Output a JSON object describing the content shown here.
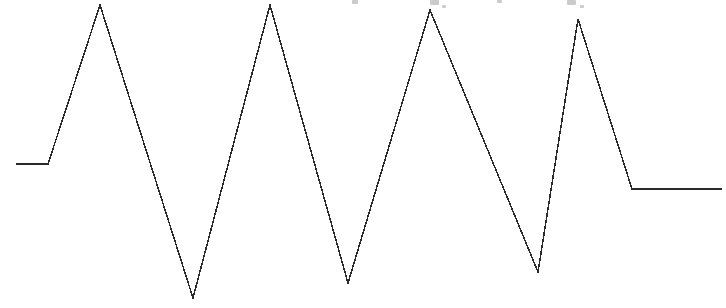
{
  "canvas": {
    "width": 726,
    "height": 308,
    "background_color": "#ffffff"
  },
  "plot": {
    "name": "waveform-trace",
    "stroke_color": "#2b2b2b",
    "stroke_width": 1.5,
    "fill": "none"
  },
  "clipped_text": {
    "description": "faint gray remnants of a text line cropped off the top edge",
    "color": "#b9b9b9",
    "fragments": [
      {
        "x": 352,
        "y": 0,
        "w": 6,
        "h": 4
      },
      {
        "x": 430,
        "y": 0,
        "w": 9,
        "h": 5
      },
      {
        "x": 442,
        "y": 5,
        "w": 4,
        "h": 3
      },
      {
        "x": 497,
        "y": 0,
        "w": 5,
        "h": 3
      },
      {
        "x": 567,
        "y": 0,
        "w": 9,
        "h": 5
      },
      {
        "x": 580,
        "y": 5,
        "w": 4,
        "h": 3
      }
    ]
  },
  "chart_data": {
    "type": "line",
    "title": "",
    "subtitle": "",
    "xlabel": "",
    "ylabel": "",
    "xlim": [
      0,
      726
    ],
    "ylim": [
      308,
      0
    ],
    "grid": false,
    "axes_visible": false,
    "legend": null,
    "legend_position": "none",
    "annotations": [],
    "tick_labels": {
      "x": [],
      "y": []
    },
    "series": [
      {
        "name": "triangular-waveform",
        "color": "#2b2b2b",
        "marker": "none",
        "linewidth": 1.5,
        "x": [
          16,
          48,
          100,
          193,
          270,
          348,
          430,
          538,
          578,
          632,
          722
        ],
        "y": [
          164,
          164,
          5,
          298,
          5,
          283,
          10,
          272,
          19,
          189,
          189
        ],
        "vertex_labels": [
          "flat-start-left",
          "flat-start-right",
          "peak-1",
          "valley-1",
          "peak-2",
          "valley-2",
          "peak-3",
          "valley-3",
          "peak-4",
          "flat-end-left",
          "flat-end-right"
        ]
      }
    ],
    "features": {
      "peak_count": 4,
      "valley_count": 3,
      "peaks": [
        {
          "label": "peak-1",
          "x": 100,
          "y": 5
        },
        {
          "label": "peak-2",
          "x": 270,
          "y": 5
        },
        {
          "label": "peak-3",
          "x": 430,
          "y": 10
        },
        {
          "label": "peak-4",
          "x": 578,
          "y": 19
        }
      ],
      "valleys": [
        {
          "label": "valley-1",
          "x": 193,
          "y": 298
        },
        {
          "label": "valley-2",
          "x": 348,
          "y": 283
        },
        {
          "label": "valley-3",
          "x": 538,
          "y": 272
        }
      ],
      "baseline_start": {
        "x_from": 16,
        "x_to": 48,
        "y": 164
      },
      "baseline_end": {
        "x_from": 632,
        "x_to": 722,
        "y": 189
      }
    },
    "path_d": "M 16,164 L 48,164 L 100,5 L 193,298 L 270,5 L 348,283 L 430,10 L 538,272 L 578,19 L 632,189 L 722,189"
  }
}
